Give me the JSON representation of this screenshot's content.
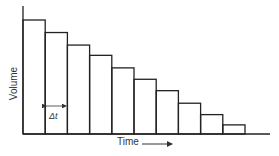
{
  "chart_data": {
    "type": "bar",
    "title": "",
    "xlabel": "Time",
    "ylabel": "Volume",
    "annotation": "Δt",
    "categories": [
      "1",
      "2",
      "3",
      "4",
      "5",
      "6",
      "7",
      "8",
      "9",
      "10"
    ],
    "values": [
      100,
      89,
      78,
      69,
      58,
      48,
      38,
      27,
      17,
      8
    ],
    "ylim": [
      0,
      110
    ],
    "grid": false,
    "legend": "none",
    "ticks": false
  },
  "labels": {
    "ylabel": "Volume",
    "xlabel": "Time",
    "delta_t": "Δt"
  },
  "colors": {
    "stroke": "#222222",
    "text": "#333333"
  }
}
